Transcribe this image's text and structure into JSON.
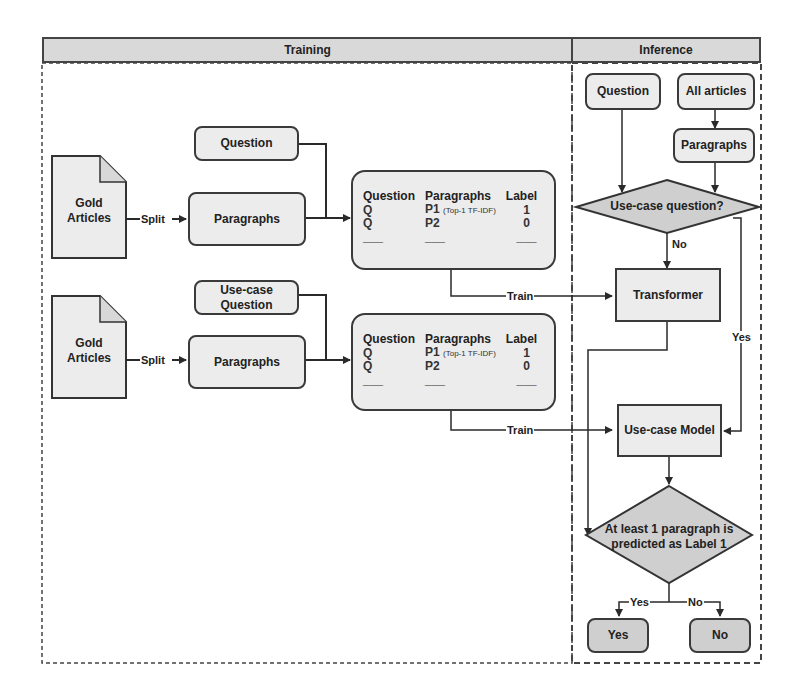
{
  "headers": {
    "training": "Training",
    "inference": "Inference"
  },
  "training": {
    "rows": [
      {
        "gold_articles": "Gold Articles",
        "split_label": "Split",
        "question": "Question",
        "paragraphs": "Paragraphs",
        "train_label": "Train",
        "table": {
          "columns": [
            "Question",
            "Paragraphs",
            "Label"
          ],
          "rows": [
            {
              "question": "Q",
              "paragraph": "P1",
              "note": "(Top-1 TF-IDF)",
              "label": "1"
            },
            {
              "question": "Q",
              "paragraph": "P2",
              "note": "",
              "label": "0"
            },
            {
              "question": "___",
              "paragraph": "___",
              "note": "",
              "label": "___"
            }
          ]
        }
      },
      {
        "gold_articles": "Gold Articles",
        "split_label": "Split",
        "question": "Use-case Question",
        "paragraphs": "Paragraphs",
        "train_label": "Train",
        "table": {
          "columns": [
            "Question",
            "Paragraphs",
            "Label"
          ],
          "rows": [
            {
              "question": "Q",
              "paragraph": "P1",
              "note": "(Top-1 TF-IDF)",
              "label": "1"
            },
            {
              "question": "Q",
              "paragraph": "P2",
              "note": "",
              "label": "0"
            },
            {
              "question": "___",
              "paragraph": "___",
              "note": "",
              "label": "___"
            }
          ]
        }
      }
    ]
  },
  "inference": {
    "question": "Question",
    "all_articles": "All articles",
    "paragraphs": "Paragraphs",
    "decision_usecase": "Use-case question?",
    "no_label": "No",
    "yes_label": "Yes",
    "transformer": "Transformer",
    "usecase_model": "Use-case Model",
    "decision_final": "At least 1 paragraph is predicted as Label 1",
    "branch_yes": "Yes",
    "branch_no": "No",
    "out_yes": "Yes",
    "out_no": "No"
  },
  "colors": {
    "box_fill": "#ececec",
    "dark_fill": "#cfcfcf",
    "header_fill": "#d9d9d9",
    "stroke": "#3a3a3a"
  }
}
